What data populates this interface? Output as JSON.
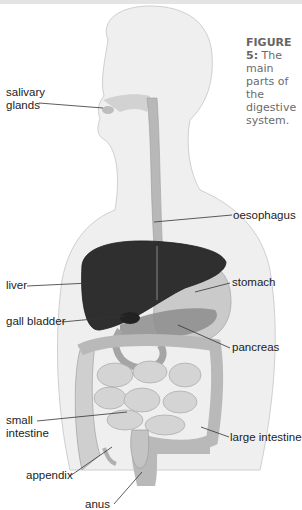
{
  "figure": {
    "number_label": "FIGURE 5:",
    "caption_text": "The main parts of the digestive system."
  },
  "labels": {
    "salivary_glands": [
      "salivary",
      "glands"
    ],
    "oesophagus": "oesophagus",
    "liver": "liver",
    "stomach": "stomach",
    "gall_bladder": "gall bladder",
    "pancreas": "pancreas",
    "small_intestine": [
      "small",
      "intestine"
    ],
    "large_intestine": "large intestine",
    "appendix": "appendix",
    "anus": "anus"
  },
  "colors": {
    "body_silhouette": "#eeeeee",
    "liver": "#2e2e2e",
    "stomach": "#c8c8c8",
    "intestine": "#cfcfcf",
    "oesophagus": "#b4b4b4",
    "pancreas": "#8a8a8a",
    "caption": "#6b6b6b"
  }
}
